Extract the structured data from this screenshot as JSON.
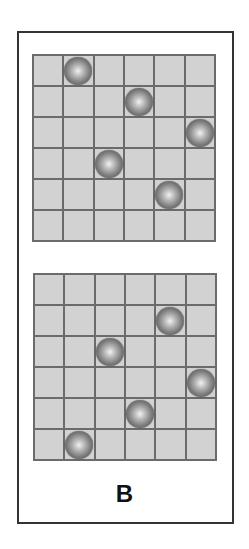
{
  "figure": {
    "label": "B",
    "grid_size": 6,
    "colors": {
      "cell": "#d2d2d2",
      "gridline": "#6b6b6b",
      "border": "#333333",
      "ball_highlight": "#f2f2f2",
      "ball_shadow": "#444444"
    },
    "grids": [
      {
        "name": "top",
        "balls": [
          {
            "row": 0,
            "col": 1
          },
          {
            "row": 1,
            "col": 3
          },
          {
            "row": 2,
            "col": 5
          },
          {
            "row": 3,
            "col": 2
          },
          {
            "row": 4,
            "col": 4
          }
        ]
      },
      {
        "name": "bottom",
        "balls": [
          {
            "row": 1,
            "col": 4
          },
          {
            "row": 2,
            "col": 2
          },
          {
            "row": 3,
            "col": 5
          },
          {
            "row": 4,
            "col": 3
          },
          {
            "row": 5,
            "col": 1
          }
        ]
      }
    ]
  }
}
